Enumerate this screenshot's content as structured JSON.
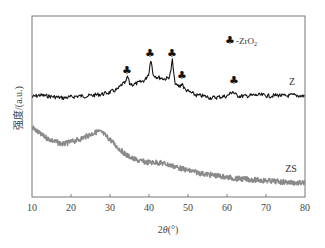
{
  "chart_data": {
    "type": "line",
    "title": "",
    "xlabel": "2θ(°)",
    "ylabel": "强度/(a.u.)",
    "xlim": [
      10,
      80
    ],
    "x_ticks": [
      10,
      20,
      30,
      40,
      50,
      60,
      70,
      80
    ],
    "y_ticks": [],
    "grid": false,
    "legend": {
      "position": "top-right",
      "entries": [
        {
          "symbol": "♣",
          "label": "-ZrO",
          "subscript": "2"
        }
      ]
    },
    "series": [
      {
        "name": "Z",
        "color": "#111111",
        "x": [
          10,
          12,
          14,
          16,
          18,
          20,
          22,
          24,
          26,
          28,
          30,
          32,
          33,
          34,
          34.5,
          35,
          36,
          38,
          39,
          40,
          40.5,
          41,
          42,
          44,
          45,
          45.5,
          46,
          46.5,
          47,
          48,
          48.5,
          49,
          50,
          52,
          54,
          56,
          58,
          60,
          61.5,
          62,
          63,
          65,
          67,
          69,
          71,
          73,
          75,
          77,
          79,
          80
        ],
        "values": [
          100,
          102,
          101,
          100,
          99,
          100,
          101,
          101,
          102,
          103,
          105,
          108,
          113,
          115,
          122,
          114,
          113,
          116,
          118,
          125,
          142,
          124,
          121,
          119,
          120,
          125,
          139,
          118,
          112,
          111,
          115,
          109,
          106,
          102,
          101,
          99,
          100,
          101,
          106,
          103,
          101,
          101,
          102,
          102,
          101,
          102,
          101,
          102,
          101,
          101
        ]
      },
      {
        "name": "ZS",
        "color": "#888888",
        "x": [
          10,
          12,
          14,
          16,
          18,
          20,
          22,
          24,
          26,
          27,
          28,
          30,
          32,
          34,
          36,
          38,
          40,
          42,
          44,
          46,
          48,
          50,
          54,
          58,
          62,
          66,
          70,
          74,
          78,
          80
        ],
        "values": [
          78,
          72,
          68,
          65,
          63,
          65,
          67,
          70,
          73,
          74,
          73,
          67,
          60,
          54,
          50,
          48,
          47,
          47,
          46,
          44,
          42,
          40,
          37,
          35,
          33,
          32,
          31,
          30,
          29,
          29
        ]
      }
    ],
    "annotations": [
      {
        "symbol": "♣",
        "x": 34.5,
        "label": "ZrO2 peak"
      },
      {
        "symbol": "♣",
        "x": 40.5,
        "label": "ZrO2 peak"
      },
      {
        "symbol": "♣",
        "x": 46,
        "label": "ZrO2 peak"
      },
      {
        "symbol": "♣",
        "x": 48.5,
        "label": "ZrO2 peak"
      },
      {
        "symbol": "♣",
        "x": 61.5,
        "label": "ZrO2 peak"
      }
    ],
    "series_labels": [
      {
        "text": "Z",
        "x": 77,
        "near": "Z"
      },
      {
        "text": "ZS",
        "x": 76,
        "near": "ZS"
      }
    ]
  },
  "labels": {
    "xlabel_prefix": "2",
    "xlabel_theta": "θ",
    "xlabel_suffix": "(°)",
    "ylabel": "强度/(a.u.)",
    "legend_symbol": "♣",
    "legend_text": "-ZrO",
    "legend_sub": "2",
    "z_label": "Z",
    "zs_label": "ZS",
    "tick_10": "10",
    "tick_20": "20",
    "tick_30": "30",
    "tick_40": "40",
    "tick_50": "50",
    "tick_60": "60",
    "tick_70": "70",
    "tick_80": "80"
  }
}
